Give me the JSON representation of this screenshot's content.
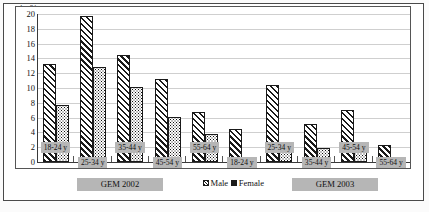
{
  "chart_data": {
    "type": "bar",
    "title": "",
    "xlabel": "",
    "ylabel": "in %",
    "ylim": [
      0,
      20
    ],
    "yticks": [
      0,
      2,
      4,
      6,
      8,
      10,
      12,
      14,
      16,
      18,
      20
    ],
    "grid": true,
    "legend_position": "bottom-center",
    "categories": [
      "18-24 y",
      "25-34 y",
      "35-44 y",
      "45-54 y",
      "55-64 y",
      "18-24 y",
      "25-34 y",
      "35-44 y",
      "45-54 y",
      "55-64 y"
    ],
    "panels": [
      {
        "label": "GEM 2002",
        "categories": [
          "18-24 y",
          "25-34 y",
          "35-44 y",
          "45-54 y",
          "55-64 y"
        ]
      },
      {
        "label": "GEM 2003",
        "categories": [
          "18-24 y",
          "25-34 y",
          "35-44 y",
          "45-54 y",
          "55-64 y"
        ]
      }
    ],
    "series": [
      {
        "name": "Male",
        "values": [
          13.2,
          19.7,
          14.5,
          11.2,
          6.8,
          4.5,
          10.4,
          5.2,
          7.0,
          2.3
        ]
      },
      {
        "name": "Female",
        "values": [
          7.7,
          12.8,
          10.1,
          6.1,
          3.8,
          0.5,
          2.2,
          1.9,
          2.0,
          0.0
        ]
      }
    ]
  },
  "axis": {
    "unit_label": "in %",
    "ticks": [
      "20",
      "18",
      "16",
      "14",
      "12",
      "10",
      "8",
      "6",
      "4",
      "2",
      "0"
    ]
  },
  "groups": [
    {
      "label": "18-24 y",
      "male": 13.2,
      "female": 7.7,
      "label_top": 128
    },
    {
      "label": "25-34 y",
      "male": 19.7,
      "female": 12.8,
      "label_top": 143
    },
    {
      "label": "35-44 y",
      "male": 14.5,
      "female": 10.1,
      "label_top": 128
    },
    {
      "label": "45-54 y",
      "male": 11.2,
      "female": 6.1,
      "label_top": 143
    },
    {
      "label": "55-64 y",
      "male": 6.8,
      "female": 3.8,
      "label_top": 128
    },
    {
      "label": "18-24 y",
      "male": 4.5,
      "female": 0.5,
      "label_top": 143
    },
    {
      "label": "25-34 y",
      "male": 10.4,
      "female": 2.2,
      "label_top": 128
    },
    {
      "label": "35-44 y",
      "male": 5.2,
      "female": 1.9,
      "label_top": 143
    },
    {
      "label": "45-54 y",
      "male": 7.0,
      "female": 2.0,
      "label_top": 128
    },
    {
      "label": "55-64 y",
      "male": 2.3,
      "female": 0.0,
      "label_top": 143
    }
  ],
  "legend": {
    "male_label": "Male",
    "female_label": "Female"
  },
  "periods": {
    "left_label": "GEM 2002",
    "right_label": "GEM 2003"
  },
  "colors": {
    "label_background": "#b6b6b6",
    "bar_outline": "#1a1a1a",
    "gridline": "#cfcfcf",
    "axis": "#3a3a3a"
  }
}
